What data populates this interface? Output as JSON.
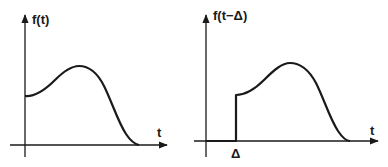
{
  "diagram": {
    "left_plot": {
      "y_label": "f(t)",
      "x_label": "t",
      "description": "Original signal f(t): starts at nonzero value at t=0, rises to a peak, falls to zero"
    },
    "right_plot": {
      "y_label": "f(t−Δ)",
      "x_label": "t",
      "shift_label": "Δ",
      "description": "Time-shifted signal f(t-Δ): zero until Δ, then same shape as f(t)"
    },
    "colors": {
      "ink": "#1a1a1a",
      "background": "#ffffff"
    }
  }
}
